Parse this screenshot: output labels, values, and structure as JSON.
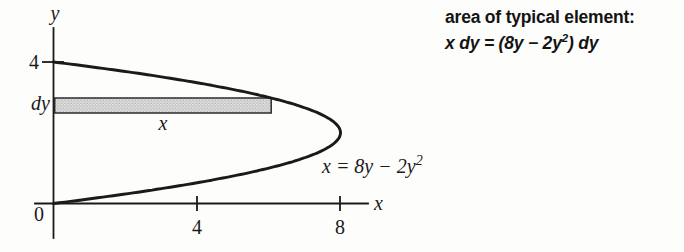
{
  "annotation": {
    "line1": "area of typical element:",
    "line2_pre": "x dy = (8y − 2y",
    "line2_sup": "2",
    "line2_post": ") dy"
  },
  "figure": {
    "y_axis_label": "y",
    "x_axis_label": "x",
    "origin_label": "0",
    "y_tick_label": "4",
    "x_tick_labels": [
      "4",
      "8"
    ],
    "dy_label": "dy",
    "element_width_label": "x",
    "curve_label_pre": "x = 8y − 2y",
    "curve_label_sup": "2"
  },
  "chart_data": {
    "type": "line",
    "title": "",
    "equation": "x = 8y − 2y^2",
    "curve": {
      "linear_coeff": 8,
      "quad_coeff": -2,
      "y_min": 0,
      "y_max": 4
    },
    "x_ticks": [
      4,
      8
    ],
    "y_ticks": [
      4
    ],
    "xlim": [
      0,
      9.3
    ],
    "ylim": [
      0,
      5.2
    ],
    "grid": false,
    "element_rect": {
      "x_left": 0,
      "y_top": 2.983,
      "y_bottom": 2.559,
      "right_edge": "on curve at y_top"
    },
    "annotations": [
      "area of typical element: x dy = (8y − 2y^2) dy",
      "x = 8y − 2y^2"
    ]
  },
  "colors": {
    "background": "#fdfdfc",
    "ink": "#1a1a1a",
    "element_fill": "#dcdcdc",
    "element_border": "#2b2b2b"
  }
}
